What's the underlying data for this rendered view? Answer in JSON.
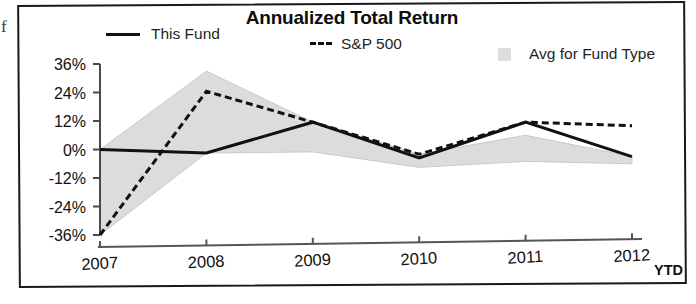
{
  "scan": {
    "edge_glyph": "f"
  },
  "chart": {
    "title": "Annualized Total Return",
    "ytd_note": "YTD",
    "legend": [
      {
        "name": "this-fund",
        "label": "This Fund",
        "marker": "solid-line",
        "color": "#111111"
      },
      {
        "name": "sp-500",
        "label": "S&P 500",
        "marker": "dashed-line",
        "color": "#111111"
      },
      {
        "name": "avg-for-fund-type",
        "label": "Avg for Fund Type",
        "marker": "area-swatch",
        "color": "#dcdcdc"
      }
    ]
  },
  "chart_data": {
    "type": "line",
    "title": "Annualized Total Return",
    "xlabel": "",
    "ylabel": "",
    "grid": false,
    "legend_position": "top",
    "categories": [
      "2007",
      "2008",
      "2009",
      "2010",
      "2011",
      "2012"
    ],
    "ytick_labels": [
      "36%",
      "24%",
      "12%",
      "0%",
      "-12%",
      "-24%",
      "-36%"
    ],
    "yticks": [
      36,
      24,
      12,
      0,
      -12,
      -24,
      -36
    ],
    "ylim": [
      -36,
      36
    ],
    "series": [
      {
        "name": "This Fund",
        "style": "solid",
        "values": [
          0,
          -1.5,
          11.5,
          -3.5,
          11.5,
          -3
        ]
      },
      {
        "name": "S&P 500",
        "style": "dashed",
        "values": [
          -36,
          24.5,
          11.5,
          -2,
          11.5,
          10
        ]
      },
      {
        "name": "Avg for Fund Type",
        "style": "band",
        "upper": [
          0,
          33,
          11.5,
          -2,
          6,
          -3
        ],
        "lower": [
          -36,
          -1.5,
          -1,
          -7.5,
          -5,
          -6
        ]
      }
    ]
  }
}
